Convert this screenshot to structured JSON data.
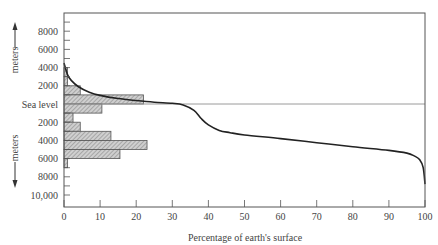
{
  "chart_data": {
    "type": "bar",
    "title": "",
    "xlabel": "Percentage of earth's surface",
    "ylabel_top": "meters",
    "ylabel_bottom": "meters",
    "xlim": [
      0,
      100
    ],
    "ylim_meters": [
      10500,
      -10500
    ],
    "x_ticks": [
      "0",
      "10",
      "20",
      "30",
      "40",
      "50",
      "60",
      "70",
      "80",
      "90",
      "100"
    ],
    "y_ticks_above": [
      "8000",
      "6000",
      "4000",
      "2000"
    ],
    "y_sea_level_label": "Sea level",
    "y_ticks_below": [
      "2000",
      "4000",
      "6000",
      "8000",
      "10,000"
    ],
    "grid": false,
    "legend": null,
    "histogram": {
      "description": "Percentage of earth's surface in each 1000 m elevation band",
      "bands": [
        {
          "range_m": "3000 to 4000",
          "percent": 1
        },
        {
          "range_m": "2000 to 3000",
          "percent": 1
        },
        {
          "range_m": "1000 to 2000",
          "percent": 4.5
        },
        {
          "range_m": "0 to 1000",
          "percent": 22
        },
        {
          "range_m": "0 to -1000",
          "percent": 10.5
        },
        {
          "range_m": "-1000 to -2000",
          "percent": 2.5
        },
        {
          "range_m": "-2000 to -3000",
          "percent": 4.5
        },
        {
          "range_m": "-3000 to -4000",
          "percent": 13
        },
        {
          "range_m": "-4000 to -5000",
          "percent": 23
        },
        {
          "range_m": "-5000 to -6000",
          "percent": 15.5
        },
        {
          "range_m": "-6000 to -7000",
          "percent": 1
        }
      ]
    },
    "hypsometric_curve": {
      "description": "Cumulative percentage of surface above given elevation",
      "x": [
        0,
        1,
        2,
        4,
        7,
        10,
        15,
        20,
        25,
        30,
        33,
        36,
        38,
        40,
        43,
        46,
        50,
        60,
        70,
        80,
        90,
        95,
        97,
        98.5,
        99.5,
        100
      ],
      "y_meters": [
        4500,
        3200,
        2600,
        1900,
        1300,
        950,
        600,
        380,
        200,
        80,
        -100,
        -700,
        -1600,
        -2300,
        -2900,
        -3150,
        -3400,
        -3800,
        -4250,
        -4700,
        -5100,
        -5400,
        -5700,
        -6100,
        -7000,
        -8800
      ]
    }
  }
}
